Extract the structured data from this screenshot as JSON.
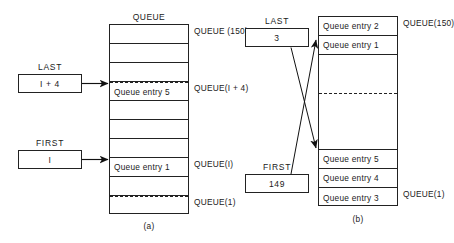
{
  "figure": {
    "panels": [
      {
        "id": "a",
        "caption": "(a)",
        "column_title": "QUEUE",
        "cells": [
          {
            "text": "",
            "dashed_top": false
          },
          {
            "text": "",
            "dashed_top": false
          },
          {
            "text": "",
            "dashed_top": false
          },
          {
            "text": "Queue entry 5",
            "dashed_top": true
          },
          {
            "text": "",
            "dashed_top": false
          },
          {
            "text": "",
            "dashed_top": false
          },
          {
            "text": "",
            "dashed_top": false
          },
          {
            "text": "Queue entry 1",
            "dashed_top": false
          },
          {
            "text": "",
            "dashed_top": false
          },
          {
            "text": "",
            "dashed_top": true
          }
        ],
        "side_labels": [
          {
            "text": "QUEUE (150)"
          },
          {
            "text": "QUEUE(I + 4)"
          },
          {
            "text": "QUEUE(I)"
          },
          {
            "text": "QUEUE(1)"
          }
        ],
        "pointers": [
          {
            "name": "LAST",
            "label": "LAST",
            "value": "I + 4"
          },
          {
            "name": "FIRST",
            "label": "FIRST",
            "value": "I"
          }
        ]
      },
      {
        "id": "b",
        "caption": "(b)",
        "column_title": "",
        "cells": [
          {
            "text": "Queue entry 2",
            "dashed_top": false
          },
          {
            "text": "Queue entry 1",
            "dashed_top": false
          },
          {
            "text": "",
            "dashed_top": false
          },
          {
            "text": "",
            "dashed_top": false
          },
          {
            "text": "",
            "dashed_top": true
          },
          {
            "text": "",
            "dashed_top": false
          },
          {
            "text": "",
            "dashed_top": false
          },
          {
            "text": "Queue entry 5",
            "dashed_top": false
          },
          {
            "text": "Queue entry 4",
            "dashed_top": false
          },
          {
            "text": "Queue entry 3",
            "dashed_top": false
          }
        ],
        "side_labels": [
          {
            "text": "QUEUE(150)"
          },
          {
            "text": "QUEUE(1)"
          }
        ],
        "pointers": [
          {
            "name": "LAST",
            "label": "LAST",
            "value": "3"
          },
          {
            "name": "FIRST",
            "label": "FIRST",
            "value": "149"
          }
        ]
      }
    ],
    "colors": {
      "stroke": "#222222",
      "text": "#1a1a1a",
      "background": "#ffffff"
    }
  }
}
